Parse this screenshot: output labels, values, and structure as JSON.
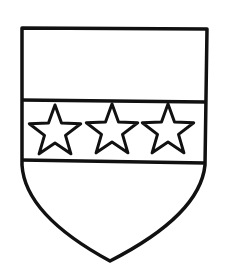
{
  "figure": {
    "colors": {
      "line": "#111111",
      "field": "#ffffff"
    },
    "charges": [
      {
        "type": "star",
        "cx": 55,
        "cy": 132
      },
      {
        "type": "star",
        "cx": 112,
        "cy": 131
      },
      {
        "type": "star",
        "cx": 168,
        "cy": 131
      }
    ]
  }
}
